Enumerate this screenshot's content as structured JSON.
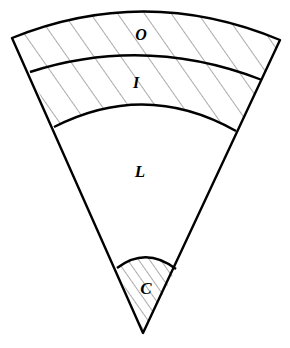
{
  "diagram": {
    "type": "layered-sector",
    "layers": [
      {
        "id": "O",
        "label": "O",
        "hatched": true,
        "position": "outermost"
      },
      {
        "id": "I",
        "label": "I",
        "hatched": true,
        "position": "second"
      },
      {
        "id": "L",
        "label": "L",
        "hatched": false,
        "position": "middle"
      },
      {
        "id": "C",
        "label": "C",
        "hatched": true,
        "position": "core-apex"
      }
    ],
    "colors": {
      "stroke": "#000000",
      "hatch": "#333333",
      "background": "#ffffff"
    }
  }
}
